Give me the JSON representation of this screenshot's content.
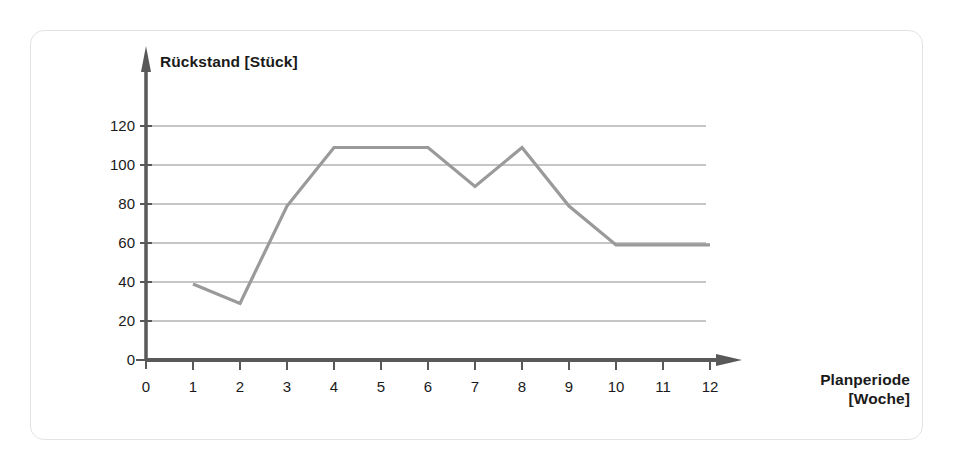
{
  "chart_data": {
    "type": "line",
    "title": "",
    "xlabel": "Planperiode [Woche]",
    "ylabel": "Rückstand [Stück]",
    "x": [
      1,
      2,
      3,
      4,
      5,
      6,
      7,
      8,
      9,
      10,
      11,
      12
    ],
    "values": [
      39,
      29,
      79,
      109,
      109,
      109,
      89,
      109,
      79,
      59,
      59,
      59
    ],
    "series": [
      {
        "name": "Rückstand",
        "values": [
          39,
          29,
          79,
          109,
          109,
          109,
          89,
          109,
          79,
          59,
          59,
          59
        ]
      }
    ],
    "xlim": [
      0,
      12
    ],
    "ylim": [
      0,
      120
    ],
    "xticks": [
      "0",
      "1",
      "2",
      "3",
      "4",
      "5",
      "6",
      "7",
      "8",
      "9",
      "10",
      "11",
      "12"
    ],
    "yticks": [
      "0",
      "20",
      "40",
      "60",
      "80",
      "100",
      "120"
    ],
    "grid": "horizontal",
    "legend": "none",
    "colors": {
      "line": "#9a9a9a",
      "axis": "#595959",
      "grid": "#8c8c8c",
      "text": "#1a1a1a",
      "frame": "#e3e3e3",
      "background": "#ffffff"
    }
  },
  "axes": {
    "y_title": "Rückstand [Stück]",
    "x_title_line1": "Planperiode",
    "x_title_line2": "[Woche]"
  },
  "y_tick_labels": [
    "120",
    "100",
    "80",
    "60",
    "40",
    "20",
    "0"
  ],
  "x_tick_labels": [
    "0",
    "1",
    "2",
    "3",
    "4",
    "5",
    "6",
    "7",
    "8",
    "9",
    "10",
    "11",
    "12"
  ]
}
